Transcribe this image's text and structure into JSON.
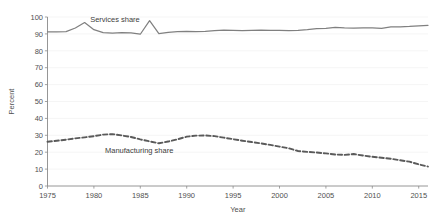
{
  "chart_data": {
    "type": "line",
    "title": "",
    "xlabel": "Year",
    "ylabel": "Percent",
    "xlim": [
      1975,
      2016
    ],
    "ylim": [
      0,
      100
    ],
    "grid": true,
    "legend_position": "inline-annotations",
    "xticks": [
      1975,
      1980,
      1985,
      1990,
      1995,
      2000,
      2005,
      2010,
      2015
    ],
    "xtick_labels": [
      "1975",
      "1980",
      "1985",
      "1990",
      "1995",
      "2000",
      "2005",
      "2010",
      "2015"
    ],
    "yticks": [
      0,
      10,
      20,
      30,
      40,
      50,
      60,
      70,
      80,
      90,
      100
    ],
    "ytick_labels": [
      "0",
      "10",
      "20",
      "30",
      "40",
      "50",
      "60",
      "70",
      "80",
      "90",
      "100"
    ],
    "x": [
      1975,
      1976,
      1977,
      1978,
      1979,
      1980,
      1981,
      1982,
      1983,
      1984,
      1985,
      1986,
      1987,
      1988,
      1989,
      1990,
      1991,
      1992,
      1993,
      1994,
      1995,
      1996,
      1997,
      1998,
      1999,
      2000,
      2001,
      2002,
      2003,
      2004,
      2005,
      2006,
      2007,
      2008,
      2009,
      2010,
      2011,
      2012,
      2013,
      2014,
      2015,
      2016
    ],
    "series": [
      {
        "name": "Services share",
        "style": "solid",
        "color": "#808080",
        "label_text": "Services share",
        "values": [
          91.2,
          91.2,
          91.3,
          93.5,
          96.7,
          92.5,
          90.8,
          90.5,
          90.8,
          90.6,
          89.8,
          97.8,
          90.2,
          90.9,
          91.3,
          91.5,
          91.4,
          91.5,
          92.0,
          92.2,
          92.1,
          92.0,
          92.1,
          92.2,
          92.1,
          92.1,
          91.9,
          92.1,
          92.5,
          93.1,
          93.3,
          93.8,
          93.5,
          93.4,
          93.5,
          93.5,
          93.3,
          94.1,
          94.2,
          94.4,
          94.8,
          95.1
        ]
      },
      {
        "name": "Manufacturing share",
        "style": "dashed",
        "color": "#5a5a5a",
        "label_text": "Manufacturing share",
        "values": [
          26.2,
          26.8,
          27.4,
          28.2,
          28.8,
          29.5,
          30.4,
          30.7,
          29.9,
          29.0,
          27.6,
          26.4,
          25.3,
          26.3,
          27.6,
          29.2,
          29.8,
          29.9,
          29.5,
          28.6,
          27.7,
          26.8,
          26.0,
          25.2,
          24.3,
          23.3,
          22.3,
          20.7,
          20.2,
          19.8,
          19.3,
          18.6,
          18.4,
          18.9,
          18.0,
          17.3,
          16.7,
          16.1,
          15.2,
          14.4,
          12.8,
          11.5
        ]
      }
    ]
  },
  "annotations": {
    "services_label": "Services share",
    "manufacturing_label": "Manufacturing share"
  }
}
